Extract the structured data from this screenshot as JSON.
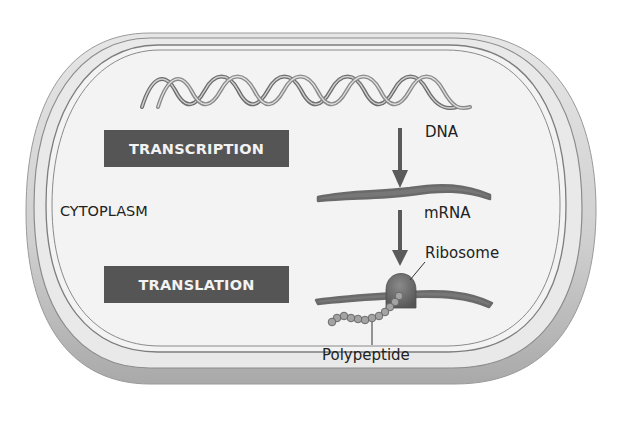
{
  "diagram": {
    "region_label": "CYTOPLASM",
    "process_boxes": [
      {
        "label": "TRANSCRIPTION"
      },
      {
        "label": "TRANSLATION"
      }
    ],
    "molecule_labels": {
      "dna": "DNA",
      "mrna": "mRNA",
      "ribosome": "Ribosome",
      "polypeptide": "Polypeptide"
    },
    "flow": [
      "DNA",
      "mRNA",
      "Ribosome",
      "Polypeptide"
    ],
    "colors": {
      "cell_wall_outer": "#bdbdbd",
      "cell_interior": "#f3f3f3",
      "box_fill": "#555555",
      "box_text": "#f2f2f2",
      "strand": "#7a7a7a",
      "arrow": "#5a5a5a",
      "ribosome": "#6a6a6a",
      "amino_acid": "#9a9a9a"
    }
  }
}
